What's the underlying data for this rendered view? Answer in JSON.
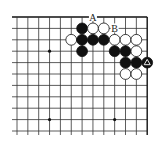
{
  "diagram": {
    "type": "go-board-fragment",
    "corner": "top-right",
    "grid": {
      "columns": 13,
      "rows": 11,
      "origin_x": 17,
      "origin_y": 17,
      "col_spacing": 10.85,
      "row_spacing": 11.4,
      "left_overhang": 5,
      "bottom_extent": 135,
      "line_color": "#333333",
      "edge_color": "#111111"
    },
    "star_points": [
      {
        "col": 3,
        "row": 3
      },
      {
        "col": 9,
        "row": 3
      },
      {
        "col": 3,
        "row": 9
      },
      {
        "col": 9,
        "row": 9
      }
    ],
    "stones": [
      {
        "color": "black",
        "col": 6,
        "row": 1
      },
      {
        "color": "white",
        "col": 7,
        "row": 1
      },
      {
        "color": "white",
        "col": 8,
        "row": 1
      },
      {
        "color": "white",
        "col": 5,
        "row": 2
      },
      {
        "color": "black",
        "col": 6,
        "row": 2
      },
      {
        "color": "black",
        "col": 7,
        "row": 2
      },
      {
        "color": "black",
        "col": 8,
        "row": 2
      },
      {
        "color": "white",
        "col": 9,
        "row": 2
      },
      {
        "color": "white",
        "col": 10,
        "row": 2
      },
      {
        "color": "white",
        "col": 11,
        "row": 2
      },
      {
        "color": "black",
        "col": 6,
        "row": 3
      },
      {
        "color": "black",
        "col": 9,
        "row": 3
      },
      {
        "color": "black",
        "col": 10,
        "row": 3
      },
      {
        "color": "white",
        "col": 11,
        "row": 3
      },
      {
        "color": "black",
        "col": 10,
        "row": 4
      },
      {
        "color": "black",
        "col": 11,
        "row": 4
      },
      {
        "color": "black",
        "col": 12,
        "row": 4,
        "mark": "triangle"
      },
      {
        "color": "white",
        "col": 10,
        "row": 5
      },
      {
        "color": "white",
        "col": 11,
        "row": 5
      }
    ],
    "labels": [
      {
        "text": "A",
        "col": 7,
        "row": 0
      },
      {
        "text": "B",
        "col": 9,
        "row": 1
      }
    ],
    "marks": [
      {
        "type": "triangle-icon",
        "col": 12,
        "row": 4,
        "on": "black"
      }
    ]
  }
}
